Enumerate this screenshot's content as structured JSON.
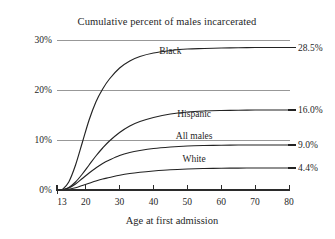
{
  "chart_data": {
    "type": "line",
    "title": "Cumulative percent of males incarcerated",
    "xlabel": "Age at first admission",
    "ylabel": "",
    "xlim": [
      13,
      80
    ],
    "ylim": [
      0,
      31
    ],
    "grid": true,
    "gridlines_y": [
      10,
      20,
      30
    ],
    "legend_position": "inline-right-of-curve",
    "xticks": [
      13,
      20,
      30,
      40,
      50,
      60,
      70,
      80
    ],
    "xtick_labels": [
      "13",
      "20",
      "30",
      "40",
      "50",
      "60",
      "70",
      "80"
    ],
    "yticks": [
      0,
      10,
      20,
      30
    ],
    "ytick_labels": [
      "0%",
      "10%",
      "20%",
      "30%"
    ],
    "x": [
      13,
      15,
      17,
      19,
      21,
      23,
      25,
      27,
      30,
      33,
      36,
      40,
      45,
      50,
      55,
      60,
      65,
      70,
      75,
      80
    ],
    "series": [
      {
        "name": "Black",
        "end_value": 28.5,
        "end_label": "28.5%",
        "label_x": 45,
        "label_y": 27.2,
        "color": "#232323",
        "values": [
          0.0,
          1.6,
          5.0,
          9.5,
          14.0,
          17.6,
          20.2,
          22.2,
          24.4,
          25.8,
          26.7,
          27.4,
          27.9,
          28.2,
          28.3,
          28.4,
          28.45,
          28.5,
          28.5,
          28.5
        ]
      },
      {
        "name": "Hispanic",
        "end_value": 16.0,
        "end_label": "16.0%",
        "label_x": 52,
        "label_y": 14.6,
        "color": "#232323",
        "values": [
          0.0,
          0.5,
          1.6,
          3.2,
          5.0,
          6.8,
          8.4,
          9.8,
          11.5,
          12.8,
          13.7,
          14.5,
          15.2,
          15.6,
          15.8,
          15.9,
          15.95,
          16.0,
          16.0,
          16.0
        ]
      },
      {
        "name": "All males",
        "end_value": 9.0,
        "end_label": "9.0%",
        "label_x": 52,
        "label_y": 10.2,
        "color": "#232323",
        "values": [
          0.0,
          0.4,
          1.2,
          2.3,
          3.4,
          4.4,
          5.3,
          6.0,
          6.9,
          7.5,
          7.9,
          8.3,
          8.6,
          8.8,
          8.9,
          8.95,
          9.0,
          9.0,
          9.0,
          9.0
        ]
      },
      {
        "name": "White",
        "end_value": 4.4,
        "end_label": "4.4%",
        "label_x": 52,
        "label_y": 5.6,
        "color": "#232323",
        "values": [
          0.0,
          0.15,
          0.45,
          0.9,
          1.35,
          1.8,
          2.2,
          2.5,
          2.95,
          3.3,
          3.55,
          3.8,
          4.05,
          4.2,
          4.3,
          4.35,
          4.38,
          4.4,
          4.4,
          4.4
        ]
      }
    ]
  }
}
